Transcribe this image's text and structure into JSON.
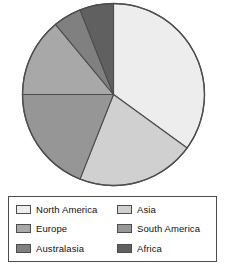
{
  "chart_data": {
    "type": "pie",
    "title": "",
    "labels": [
      "North America",
      "Asia",
      "South America",
      "Europe",
      "Australasia",
      "Africa"
    ],
    "values": [
      35,
      21,
      19,
      14,
      5,
      6
    ],
    "units": "percent",
    "start_angle_deg": 0,
    "direction": "clockwise",
    "slice_angles_deg": [
      126,
      75.6,
      68.4,
      50.4,
      18,
      21.6
    ],
    "colors": [
      "#ededed",
      "#d0d0d0",
      "#969696",
      "#a8a8a8",
      "#808080",
      "#606060"
    ],
    "stroke_color": "#4d4d4d",
    "legend_position": "bottom",
    "grid": false,
    "xlabel": "",
    "ylabel": ""
  },
  "legend": {
    "items": [
      {
        "label": "North America",
        "color": "#ededed",
        "swatch_name": "legend-swatch-north-america"
      },
      {
        "label": "Asia",
        "color": "#d0d0d0",
        "swatch_name": "legend-swatch-asia"
      },
      {
        "label": "Europe",
        "color": "#a8a8a8",
        "swatch_name": "legend-swatch-europe"
      },
      {
        "label": "South America",
        "color": "#969696",
        "swatch_name": "legend-swatch-south-america"
      },
      {
        "label": "Australasia",
        "color": "#808080",
        "swatch_name": "legend-swatch-australasia"
      },
      {
        "label": "Africa",
        "color": "#606060",
        "swatch_name": "legend-swatch-africa"
      }
    ]
  },
  "colors": {
    "outline": "#4d4d4d",
    "background": "#ffffff",
    "text": "#111111"
  }
}
